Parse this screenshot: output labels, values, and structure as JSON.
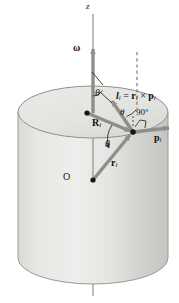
{
  "figure": {
    "kind": "physics-vector-diagram",
    "background_color": "#ffffff"
  },
  "colors": {
    "cylinder_light": "#e8e8e6",
    "cylinder_mid": "#d2d2cf",
    "cylinder_dark": "#b8b8b4",
    "cylinder_top": "#e2e2df",
    "outline": "#7a7a78",
    "vector": "#8e8e8c",
    "vector_dark": "#6e6e6c",
    "axis": "#8a8a88",
    "text": "#111111"
  },
  "labels": {
    "z_axis": "z",
    "omega": "ω",
    "theta_top": "θ",
    "angular_momentum": "l",
    "angular_momentum_sub": "i",
    "equals": " = ",
    "r_vec": "r",
    "r_vec_sub": "i",
    "cross": " × ",
    "p_vec": "p",
    "p_vec_sub": "i",
    "theta_mid": "θ",
    "right_angle": "90°",
    "R_big": "R",
    "R_big_sub": "i",
    "p_label": "p",
    "p_label_sub": "i",
    "theta_low": "θ",
    "r_small": "r",
    "r_small_sub": "i",
    "origin": "O"
  },
  "geometry": {
    "canvas_width": 179,
    "canvas_height": 303,
    "cylinder": {
      "center_x": 93,
      "top_ellipse_cy": 112,
      "bottom_ellipse_cy": 258,
      "rx": 75,
      "ry": 26
    },
    "axis": {
      "x": 93,
      "y_top": 14,
      "y_bottom": 296
    },
    "points": {
      "origin": [
        93,
        180
      ],
      "axis_point": [
        87,
        113
      ],
      "particle": [
        133,
        132
      ]
    },
    "vectors": {
      "omega": {
        "from": [
          93,
          113
        ],
        "to": [
          93,
          47
        ],
        "label": "ω"
      },
      "R_i": {
        "from": [
          87,
          113
        ],
        "to": [
          133,
          132
        ],
        "label": "R_i"
      },
      "r_i": {
        "from": [
          93,
          180
        ],
        "to": [
          133,
          132
        ],
        "label": "r_i"
      },
      "p_i": {
        "from": [
          133,
          132
        ],
        "to": [
          172,
          127
        ],
        "label": "p_i"
      },
      "l_i": {
        "from": [
          133,
          132
        ],
        "to": [
          110,
          99
        ],
        "label": "l_i"
      }
    },
    "dashed_line": {
      "x": 137,
      "y_top": 52,
      "y_bottom": 108
    },
    "angles": {
      "theta_top_deg": 35,
      "theta_mid_deg": 35,
      "theta_low_deg": 40,
      "right_angle_deg": 90
    }
  }
}
